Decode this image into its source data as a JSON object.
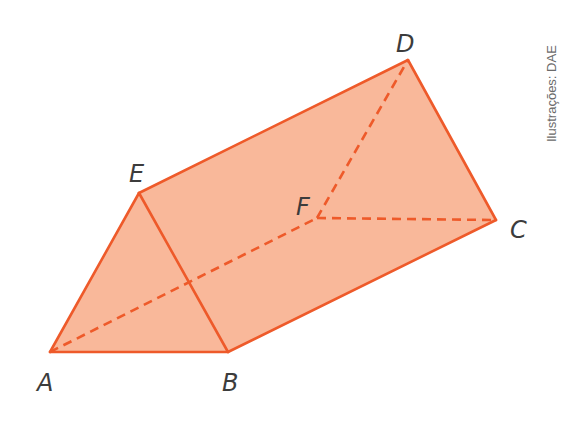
{
  "figure": {
    "type": "triangular-prism",
    "colors": {
      "fill": "#f9b89a",
      "stroke": "#ee5a2a",
      "label": "#3c3c3c",
      "credit": "#6a6a6a"
    },
    "vertices": {
      "A": {
        "label": "A",
        "x": 50,
        "y": 352
      },
      "B": {
        "label": "B",
        "x": 228,
        "y": 352
      },
      "E": {
        "label": "E",
        "x": 139,
        "y": 193
      },
      "D": {
        "label": "D",
        "x": 408,
        "y": 60
      },
      "F": {
        "label": "F",
        "x": 317,
        "y": 218
      },
      "C": {
        "label": "C",
        "x": 496,
        "y": 220
      }
    },
    "solid_edges": [
      "AB",
      "AE",
      "BE",
      "ED",
      "BC",
      "DC"
    ],
    "hidden_edges": [
      "AF",
      "FD",
      "FC"
    ],
    "credit": "Ilustrações: DAE"
  }
}
